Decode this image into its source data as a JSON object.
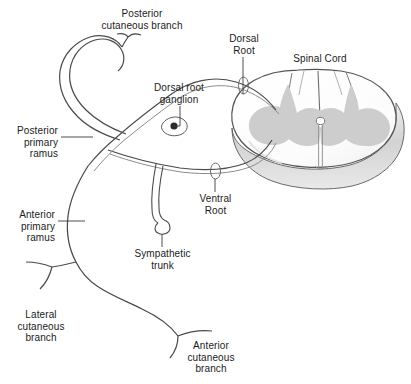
{
  "figure": {
    "title_visible": false,
    "type": "anatomical-diagram",
    "background_color": "#ffffff",
    "ink_color": "#3d3d3d",
    "text_color": "#1b1b1b",
    "gray_matter_color": "#cccccc",
    "white_matter_color": "#fbfbfb",
    "cord_edge_shade_color": "#d6d6d6"
  },
  "labels": {
    "posterior_cutaneous_branch": "Posterior\ncutaneous branch",
    "dorsal_root_ganglion": "Dorsal root\nganglion",
    "dorsal_root": "Dorsal\nRoot",
    "spinal_cord": "Spinal Cord",
    "posterior_primary_ramus": "Posterior\nprimary\nramus",
    "ventral_root": "Ventral\nRoot",
    "anterior_primary_ramus": "Anterior\nprimary\nramus",
    "sympathetic_trunk": "Sympathetic\ntrunk",
    "lateral_cutaneous_branch": "Lateral\ncutaneous\nbranch",
    "anterior_cutaneous_branch": "Anterior\ncutaneous\nbranch"
  },
  "structures": [
    {
      "name": "spinal-cord-cross-section",
      "description": "Oval cord in cross-section with H-shaped gray matter"
    },
    {
      "name": "gray-matter",
      "description": "Butterfly/H-shaped central gray matter"
    },
    {
      "name": "central-canal",
      "description": "Small opening at center of gray matter commissure"
    },
    {
      "name": "posterior-median-sulcus",
      "description": "Midline groove on dorsal surface"
    },
    {
      "name": "anterior-median-fissure",
      "description": "Midline cleft on ventral surface"
    },
    {
      "name": "dorsal-root",
      "description": "Sensory root entering dorsolateral cord"
    },
    {
      "name": "ventral-root",
      "description": "Motor root leaving ventrolateral cord"
    },
    {
      "name": "dorsal-root-ganglion",
      "description": "Swelling on dorsal root containing sensory cell bodies"
    },
    {
      "name": "spinal-nerve-trunk",
      "description": "Mixed nerve formed by union of dorsal and ventral roots"
    },
    {
      "name": "posterior-primary-ramus",
      "description": "Dorsal ramus arcing up and back"
    },
    {
      "name": "anterior-primary-ramus",
      "description": "Ventral ramus sweeping forward and down"
    },
    {
      "name": "sympathetic-trunk",
      "description": "Ganglionated chain connected by rami communicantes"
    },
    {
      "name": "posterior-cutaneous-branch",
      "description": "Terminal skin branch of dorsal ramus"
    },
    {
      "name": "lateral-cutaneous-branch",
      "description": "Skin branch arising from ventral ramus laterally"
    },
    {
      "name": "anterior-cutaneous-branch",
      "description": "Terminal skin branch of ventral ramus anteriorly"
    }
  ]
}
